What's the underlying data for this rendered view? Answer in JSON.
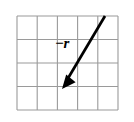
{
  "figure": {
    "type": "vector-on-grid-diagram",
    "background_color": "#ffffff",
    "label": {
      "text": "−r",
      "style": "bold-italic-serif",
      "color": "#000000",
      "x": 55,
      "y": 35
    },
    "grid": {
      "columns": 5,
      "rows": 4,
      "left": 17,
      "top": 16,
      "right": 118,
      "bottom": 110,
      "cell_width": 20.2,
      "cell_height": 23.5,
      "line_color": "#9a9a9a",
      "line_width": 1,
      "vertical_lines_x": [
        17,
        37.2,
        57.4,
        77.6,
        97.8,
        118
      ],
      "horizontal_lines_y": [
        16,
        39.5,
        63,
        86.5,
        110
      ]
    },
    "vector": {
      "name": "minus-r",
      "color": "#000000",
      "line_width": 2.6,
      "tail_x": 105,
      "tail_y": 16,
      "head_x": 62,
      "head_y": 88,
      "arrowhead": "solid-triangle",
      "arrowhead_length": 13,
      "arrowhead_width": 9,
      "grid_units_dx": -2.13,
      "grid_units_dy": 3.06
    }
  }
}
